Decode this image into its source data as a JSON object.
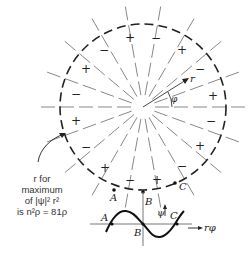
{
  "figure": {
    "type": "nodal-pattern-diagram",
    "center": [
      143,
      107
    ],
    "radius": 83,
    "n_nodal_lines": 9,
    "signs": [
      {
        "label": "+",
        "x": 213,
        "y": 96
      },
      {
        "label": "−",
        "x": 200,
        "y": 69
      },
      {
        "label": "+",
        "x": 182,
        "y": 50
      },
      {
        "label": "−",
        "x": 156,
        "y": 38
      },
      {
        "label": "+",
        "x": 130,
        "y": 38
      },
      {
        "label": "−",
        "x": 104,
        "y": 50
      },
      {
        "label": "+",
        "x": 86,
        "y": 69
      },
      {
        "label": "−",
        "x": 76,
        "y": 94
      },
      {
        "label": "+",
        "x": 76,
        "y": 121
      },
      {
        "label": "−",
        "x": 86,
        "y": 147
      },
      {
        "label": "+",
        "x": 105,
        "y": 168
      },
      {
        "label": "−",
        "x": 130,
        "y": 180
      },
      {
        "label": "+",
        "x": 157,
        "y": 180
      },
      {
        "label": "−",
        "x": 182,
        "y": 166
      },
      {
        "label": "+",
        "x": 200,
        "y": 146
      },
      {
        "label": "−",
        "x": 211,
        "y": 121
      }
    ],
    "points": [
      {
        "label": "A",
        "x": 114,
        "y": 190,
        "lx": 110,
        "ly": 201
      },
      {
        "label": "B",
        "x": 143,
        "y": 192,
        "lx": 145,
        "ly": 205
      },
      {
        "label": "C",
        "x": 175,
        "y": 183,
        "lx": 179,
        "ly": 190
      }
    ],
    "axis_labels": {
      "r": "r",
      "phi": "φ"
    },
    "caption": {
      "line1": "r for",
      "line2": "maximum",
      "line3": "of |ψ|² r²",
      "line4": "is n²ρ = 81ρ"
    },
    "inset": {
      "psi_label": "ψ",
      "x_label": "rφ",
      "points": [
        "A",
        "B",
        "C"
      ]
    }
  }
}
